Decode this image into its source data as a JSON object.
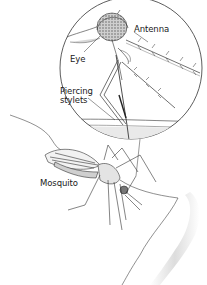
{
  "diagram": {
    "labels": {
      "antenna": "Antenna",
      "eye": "Eye",
      "piercing_line1": "Piercing",
      "piercing_line2": "stylets",
      "mosquito": "Mosquito"
    },
    "colors": {
      "ink": "#2a2a2a",
      "skin_shade": "#d9d9d9",
      "eye_fill": "#bdbdbd",
      "background": "#ffffff"
    }
  }
}
